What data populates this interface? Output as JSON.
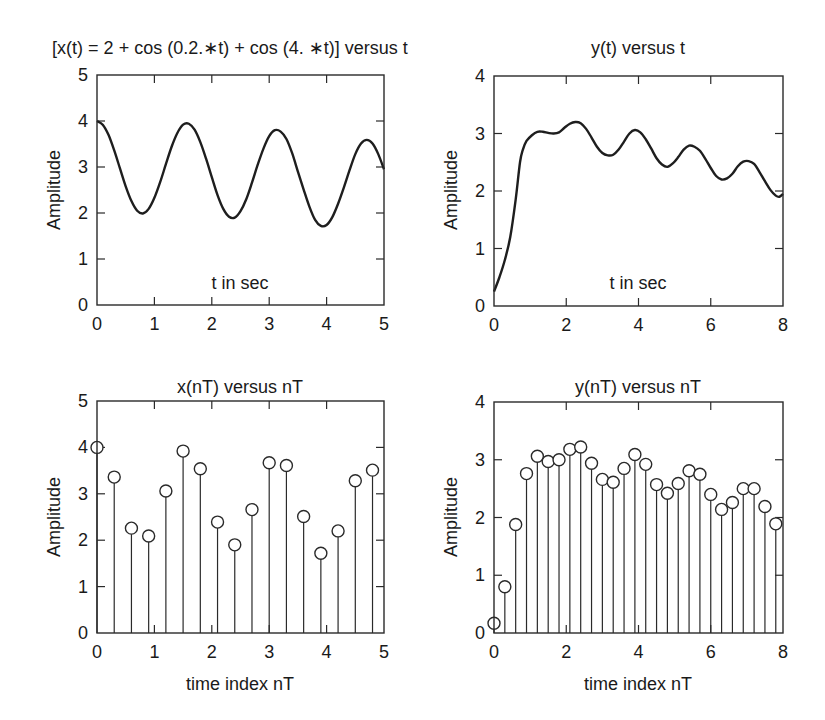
{
  "chart_data": [
    {
      "id": "xt",
      "type": "line",
      "title": "[x(t) = 2 + cos (0.2.∗t) + cos (4. ∗t)] versus t",
      "xlabel": "t in sec",
      "ylabel": "Amplitude",
      "xlim": [
        0,
        5
      ],
      "ylim": [
        0,
        5
      ],
      "xticks": [
        0,
        1,
        2,
        3,
        4,
        5
      ],
      "yticks": [
        0,
        1,
        2,
        3,
        4,
        5
      ],
      "grid": false,
      "frame": {
        "x0": 97,
        "x1": 384,
        "y0": 75,
        "y1": 305
      },
      "x": [
        0,
        0.1,
        0.2,
        0.3,
        0.4,
        0.5,
        0.6,
        0.7,
        0.8,
        0.9,
        1.0,
        1.1,
        1.2,
        1.3,
        1.4,
        1.5,
        1.6,
        1.7,
        1.8,
        1.9,
        2.0,
        2.1,
        2.2,
        2.3,
        2.4,
        2.5,
        2.6,
        2.7,
        2.8,
        2.9,
        3.0,
        3.1,
        3.2,
        3.3,
        3.4,
        3.5,
        3.6,
        3.7,
        3.8,
        3.9,
        4.0,
        4.1,
        4.2,
        4.3,
        4.4,
        4.5,
        4.6,
        4.7,
        4.8,
        4.9,
        5.0
      ],
      "y": [
        4.0,
        3.92,
        3.7,
        3.36,
        2.97,
        2.58,
        2.26,
        2.05,
        1.99,
        2.09,
        2.33,
        2.67,
        3.06,
        3.44,
        3.74,
        3.92,
        3.94,
        3.81,
        3.54,
        3.18,
        2.78,
        2.39,
        2.09,
        1.92,
        1.9,
        2.04,
        2.3,
        2.66,
        3.05,
        3.4,
        3.67,
        3.8,
        3.77,
        3.61,
        3.3,
        2.9,
        2.51,
        2.14,
        1.85,
        1.72,
        1.74,
        1.91,
        2.2,
        2.55,
        2.93,
        3.28,
        3.51,
        3.59,
        3.51,
        3.28,
        2.95
      ]
    },
    {
      "id": "yt",
      "type": "line",
      "title": "y(t) versus t",
      "xlabel": "t in sec",
      "ylabel": "Amplitude",
      "xlim": [
        0,
        8
      ],
      "ylim": [
        0,
        4
      ],
      "xticks": [
        0,
        2,
        4,
        6,
        8
      ],
      "yticks": [
        0,
        1,
        2,
        3,
        4
      ],
      "grid": false,
      "frame": {
        "x0": 494,
        "x1": 783,
        "y0": 76,
        "y1": 306
      },
      "x": [
        0,
        0.15,
        0.3,
        0.45,
        0.6,
        0.72,
        0.8,
        0.9,
        1.05,
        1.2,
        1.35,
        1.5,
        1.65,
        1.8,
        1.95,
        2.1,
        2.25,
        2.4,
        2.55,
        2.7,
        2.85,
        3.0,
        3.15,
        3.3,
        3.45,
        3.6,
        3.75,
        3.9,
        4.05,
        4.2,
        4.35,
        4.5,
        4.65,
        4.8,
        4.95,
        5.1,
        5.25,
        5.4,
        5.55,
        5.7,
        5.85,
        6.0,
        6.15,
        6.3,
        6.45,
        6.6,
        6.75,
        6.9,
        7.05,
        7.2,
        7.35,
        7.5,
        7.65,
        7.8,
        7.9,
        8.0
      ],
      "y": [
        0.25,
        0.5,
        0.8,
        1.2,
        1.85,
        2.5,
        2.72,
        2.87,
        2.97,
        3.03,
        3.03,
        3.01,
        3.0,
        3.02,
        3.1,
        3.17,
        3.2,
        3.18,
        3.08,
        2.93,
        2.77,
        2.66,
        2.62,
        2.63,
        2.72,
        2.86,
        3.0,
        3.06,
        3.02,
        2.9,
        2.74,
        2.57,
        2.46,
        2.42,
        2.48,
        2.59,
        2.72,
        2.79,
        2.77,
        2.7,
        2.56,
        2.4,
        2.26,
        2.2,
        2.22,
        2.3,
        2.43,
        2.51,
        2.52,
        2.47,
        2.33,
        2.17,
        2.02,
        1.92,
        1.9,
        1.95
      ]
    },
    {
      "id": "xnT",
      "type": "stem",
      "title": "x(nT) versus nT",
      "xlabel": "time index nT",
      "ylabel": "Amplitude",
      "xlim": [
        0,
        5
      ],
      "ylim": [
        0,
        5
      ],
      "xticks": [
        0,
        1,
        2,
        3,
        4,
        5
      ],
      "yticks": [
        0,
        1,
        2,
        3,
        4,
        5
      ],
      "grid": false,
      "frame": {
        "x0": 97,
        "x1": 384,
        "y0": 401,
        "y1": 633
      },
      "x": [
        0,
        0.3,
        0.6,
        0.9,
        1.2,
        1.5,
        1.8,
        2.1,
        2.4,
        2.7,
        3.0,
        3.3,
        3.6,
        3.9,
        4.2,
        4.5,
        4.8
      ],
      "y": [
        4.0,
        3.36,
        2.26,
        2.09,
        3.06,
        3.92,
        3.54,
        2.39,
        1.9,
        2.66,
        3.67,
        3.61,
        2.51,
        1.72,
        2.2,
        3.28,
        3.51
      ]
    },
    {
      "id": "ynT",
      "type": "stem",
      "title": "y(nT) versus nT",
      "xlabel": "time index nT",
      "ylabel": "Amplitude",
      "xlim": [
        0,
        8
      ],
      "ylim": [
        0,
        4
      ],
      "xticks": [
        0,
        2,
        4,
        6,
        8
      ],
      "yticks": [
        0,
        1,
        2,
        3,
        4
      ],
      "grid": false,
      "frame": {
        "x0": 494,
        "x1": 783,
        "y0": 402,
        "y1": 633
      },
      "x": [
        0,
        0.3,
        0.6,
        0.9,
        1.2,
        1.5,
        1.8,
        2.1,
        2.4,
        2.7,
        3.0,
        3.3,
        3.6,
        3.9,
        4.2,
        4.5,
        4.8,
        5.1,
        5.4,
        5.7,
        6.0,
        6.3,
        6.6,
        6.9,
        7.2,
        7.5,
        7.8
      ],
      "y": [
        0.17,
        0.8,
        1.88,
        2.76,
        3.06,
        2.97,
        3.0,
        3.18,
        3.22,
        2.94,
        2.66,
        2.61,
        2.85,
        3.09,
        2.92,
        2.57,
        2.42,
        2.59,
        2.81,
        2.75,
        2.4,
        2.14,
        2.26,
        2.5,
        2.5,
        2.19,
        1.89
      ]
    }
  ],
  "panels": {
    "xt": {
      "title": "[x(t) = 2 + cos (0.2.∗t) + cos (4. ∗t)] versus t",
      "xlabel": "t in sec",
      "ylabel": "Amplitude"
    },
    "yt": {
      "title": "y(t) versus t",
      "xlabel": "t in sec",
      "ylabel": "Amplitude"
    },
    "xnT": {
      "title": "x(nT) versus nT",
      "xlabel": "time index nT",
      "ylabel": "Amplitude"
    },
    "ynT": {
      "title": "y(nT) versus nT",
      "xlabel": "time index nT",
      "ylabel": "Amplitude"
    }
  },
  "colors": {
    "line": "#1e1e1e",
    "frame": "#2a2a2a",
    "background": "#ffffff"
  }
}
